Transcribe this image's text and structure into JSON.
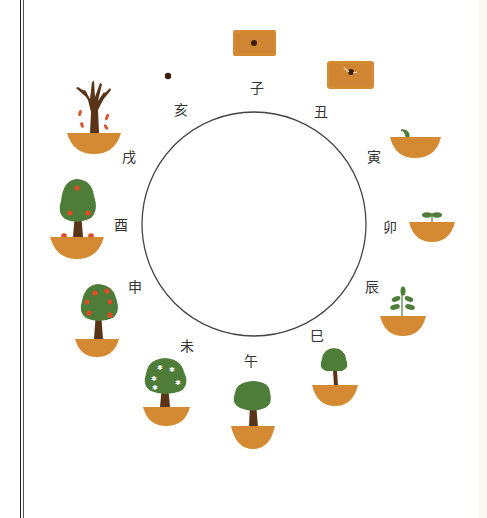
{
  "colors": {
    "soil": "#d48a32",
    "soil_dark": "#c07a2a",
    "trunk": "#5a3418",
    "leaf": "#4e7d3a",
    "fruit": "#e04a24",
    "blossom": "#ffffff",
    "seed": "#3b1f0f",
    "circle": "#444444"
  },
  "circle": {
    "cx": 254,
    "cy": 224,
    "r": 112
  },
  "branches": [
    {
      "label": "子",
      "stage": "seed-in-soil"
    },
    {
      "label": "丑",
      "stage": "seed-cracking"
    },
    {
      "label": "寅",
      "stage": "single-sprout"
    },
    {
      "label": "卯",
      "stage": "two-leaf-seedling"
    },
    {
      "label": "辰",
      "stage": "leafy-sapling"
    },
    {
      "label": "巳",
      "stage": "small-tree"
    },
    {
      "label": "午",
      "stage": "full-tree"
    },
    {
      "label": "未",
      "stage": "blossoming-tree"
    },
    {
      "label": "申",
      "stage": "fruiting-tree"
    },
    {
      "label": "酉",
      "stage": "fruit-falling-tree"
    },
    {
      "label": "戌",
      "stage": "bare-tree-falling-leaves"
    },
    {
      "label": "亥",
      "stage": "seed-alone"
    }
  ]
}
